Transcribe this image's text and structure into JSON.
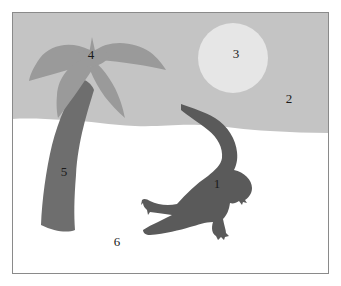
{
  "figure": {
    "colors": {
      "frame": "#8a8a8a",
      "sky": "#c4c4c4",
      "sun": "#e6e6e6",
      "sand": "#ffffff",
      "palm_leaves": "#9a9a9a",
      "palm_trunk": "#6e6e6e",
      "crocodile": "#5a5a5a",
      "label_text": "#1a1a1a"
    },
    "labels": [
      {
        "id": "1",
        "text": "1",
        "target": "crocodile",
        "x": 217,
        "y": 183
      },
      {
        "id": "2",
        "text": "2",
        "target": "sky",
        "x": 289,
        "y": 98
      },
      {
        "id": "3",
        "text": "3",
        "target": "sun",
        "x": 236,
        "y": 53
      },
      {
        "id": "4",
        "text": "4",
        "target": "palm-leaves",
        "x": 91,
        "y": 54
      },
      {
        "id": "5",
        "text": "5",
        "target": "palm-trunk",
        "x": 64,
        "y": 171
      },
      {
        "id": "6",
        "text": "6",
        "target": "sand",
        "x": 117,
        "y": 241
      }
    ]
  }
}
